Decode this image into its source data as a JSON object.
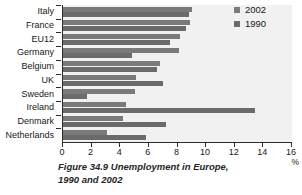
{
  "chart_data": {
    "type": "bar",
    "orientation": "horizontal",
    "title": "Figure 34.9  Unemployment in Europe, 1990 and 2002",
    "xlabel": "%",
    "ylabel": "",
    "xlim": [
      0,
      16
    ],
    "xticks": [
      0,
      2,
      4,
      6,
      8,
      10,
      12,
      14,
      16
    ],
    "grid": false,
    "legend_position": "top-right",
    "categories": [
      "Italy",
      "France",
      "EU12",
      "Germany",
      "Belgium",
      "UK",
      "Sweden",
      "Ireland",
      "Denmark",
      "Netherlands"
    ],
    "series": [
      {
        "name": "2002",
        "color": "#7a7a7a",
        "values": [
          9.0,
          8.9,
          8.2,
          8.1,
          6.8,
          5.1,
          5.0,
          4.4,
          4.2,
          3.1
        ]
      },
      {
        "name": "1990",
        "color": "#6b6b6b",
        "values": [
          8.8,
          8.6,
          7.5,
          4.8,
          6.6,
          7.0,
          1.7,
          13.4,
          7.2,
          5.8
        ]
      }
    ]
  },
  "caption": {
    "line1": "Figure 34.9  Unemployment in Europe,",
    "line2": "1990 and 2002"
  },
  "axis": {
    "x_unit": "%"
  },
  "legend": {
    "items": [
      {
        "label": "2002",
        "color": "#7a7a7a"
      },
      {
        "label": "1990",
        "color": "#6b6b6b"
      }
    ]
  }
}
